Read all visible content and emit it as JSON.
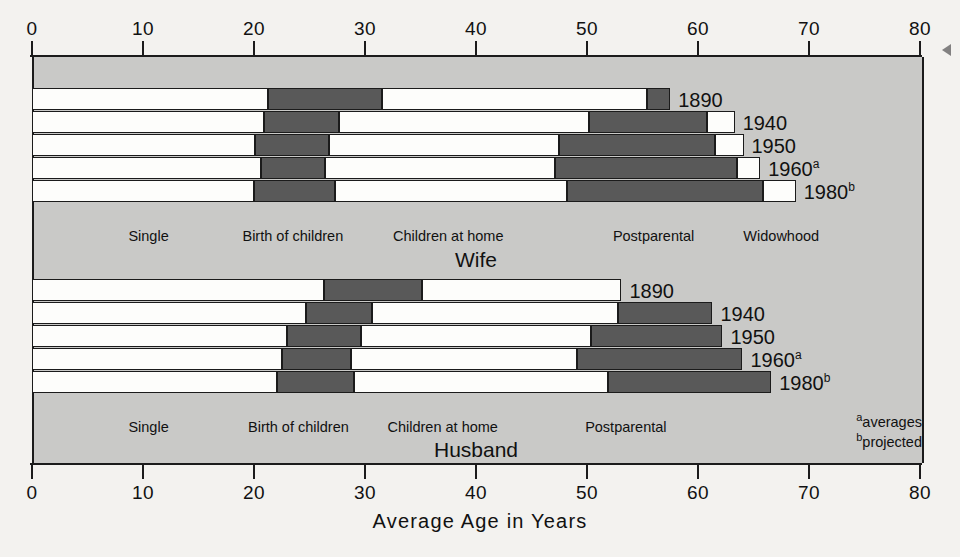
{
  "chart_data": {
    "type": "bar",
    "title": "",
    "xlabel": "Average Age in Years",
    "ylabel": "",
    "xlim": [
      0,
      80
    ],
    "xticks": [
      0,
      10,
      20,
      30,
      40,
      50,
      60,
      70,
      80
    ],
    "grid": false,
    "legend": "inline stage labels",
    "orientation": "horizontal",
    "stacked": true,
    "stage_names": [
      "Single",
      "Birth of children",
      "Children at home",
      "Postparental",
      "Widowhood"
    ],
    "panels": [
      {
        "name": "Wife",
        "title": "Wife",
        "stage_labels": [
          {
            "text": "Single",
            "at_age": 10.5
          },
          {
            "text": "Birth of children",
            "at_age": 23.5
          },
          {
            "text": "Children at home",
            "at_age": 37.5
          },
          {
            "text": "Postparental",
            "at_age": 56.0
          },
          {
            "text": "Widowhood",
            "at_age": 67.5
          }
        ],
        "rows": [
          {
            "year": "1890",
            "footnote": "",
            "single_end": 21.3,
            "birth_end": 31.5,
            "children_home_end": 55.4,
            "postparental_end": 57.5
          },
          {
            "year": "1940",
            "footnote": "",
            "single_end": 20.9,
            "birth_end": 27.7,
            "children_home_end": 50.2,
            "postparental_end": 60.8,
            "widowhood_end": 63.3
          },
          {
            "year": "1950",
            "footnote": "",
            "single_end": 20.1,
            "birth_end": 26.8,
            "children_home_end": 47.5,
            "postparental_end": 61.5,
            "widowhood_end": 64.1
          },
          {
            "year": "1960",
            "footnote": "a",
            "single_end": 20.6,
            "birth_end": 26.4,
            "children_home_end": 47.1,
            "postparental_end": 63.5,
            "widowhood_end": 65.6
          },
          {
            "year": "1980",
            "footnote": "b",
            "single_end": 20.0,
            "birth_end": 27.3,
            "children_home_end": 48.2,
            "postparental_end": 65.9,
            "widowhood_end": 68.8
          }
        ]
      },
      {
        "name": "Husband",
        "title": "Husband",
        "stage_labels": [
          {
            "text": "Single",
            "at_age": 10.5
          },
          {
            "text": "Birth of children",
            "at_age": 24.0
          },
          {
            "text": "Children at home",
            "at_age": 37.0
          },
          {
            "text": "Postparental",
            "at_age": 53.5
          }
        ],
        "rows": [
          {
            "year": "1890",
            "footnote": "",
            "single_end": 26.3,
            "birth_end": 35.1,
            "children_home_end": 53.1
          },
          {
            "year": "1940",
            "footnote": "",
            "single_end": 24.7,
            "birth_end": 30.6,
            "children_home_end": 52.8,
            "postparental_end": 61.3
          },
          {
            "year": "1950",
            "footnote": "",
            "single_end": 23.0,
            "birth_end": 29.6,
            "children_home_end": 50.4,
            "postparental_end": 62.2
          },
          {
            "year": "1960",
            "footnote": "a",
            "single_end": 22.5,
            "birth_end": 28.7,
            "children_home_end": 49.1,
            "postparental_end": 64.0
          },
          {
            "year": "1980",
            "footnote": "b",
            "single_end": 22.1,
            "birth_end": 29.0,
            "children_home_end": 51.9,
            "postparental_end": 66.6
          }
        ]
      }
    ],
    "footnotes": [
      {
        "marker": "a",
        "text": "averages"
      },
      {
        "marker": "b",
        "text": "projected"
      }
    ],
    "colors": {
      "plot_background": "#c9c9c7",
      "page_background": "#f3f2ef",
      "segment_light": "#fdfdfb",
      "segment_dark": "#595959",
      "outline": "#1b1b1b"
    }
  }
}
